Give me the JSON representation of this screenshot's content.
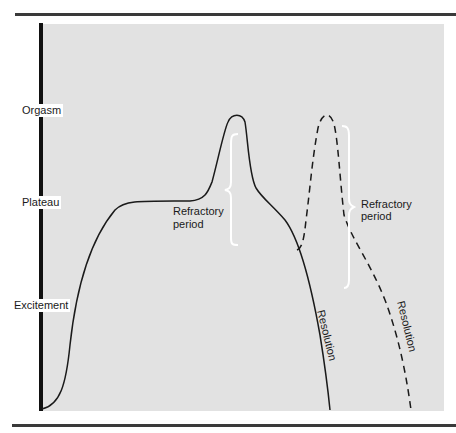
{
  "figure": {
    "y_axis_levels": [
      {
        "label": "Orgasm"
      },
      {
        "label": "Plateau"
      },
      {
        "label": "Excitement"
      }
    ],
    "annotations": {
      "refractory_1_line1": "Refractory",
      "refractory_1_line2": "period",
      "refractory_2_line1": "Refractory",
      "refractory_2_line2": "period",
      "resolution_1": "Resolution",
      "resolution_2": "Resolution"
    },
    "curves": [
      {
        "name": "first-response",
        "style": "solid"
      },
      {
        "name": "second-response",
        "style": "dashed"
      }
    ],
    "colors": {
      "background": "#e2e2e2",
      "curve": "#1a1a1a",
      "brace": "#ffffff"
    }
  }
}
